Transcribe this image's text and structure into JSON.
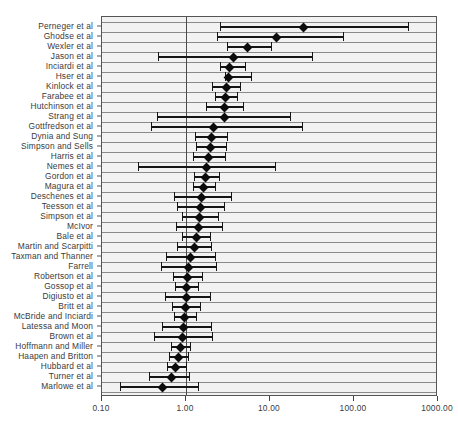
{
  "chart_data": {
    "type": "scatter",
    "subtype": "forest-plot",
    "title": "",
    "xlabel": "",
    "ylabel": "",
    "xscale": "log",
    "xlim": [
      0.1,
      1000.0
    ],
    "xticks": [
      0.1,
      1.0,
      10.0,
      100.0,
      1000.0
    ],
    "xtick_labels": [
      "0.10",
      "1.00",
      "10.00",
      "100.00",
      "1000.00"
    ],
    "reference_line": 1.0,
    "grid": true,
    "legend": "none",
    "marker": "diamond",
    "categories": [
      "Perneger et al",
      "Ghodse et al",
      "Wexler et al",
      "Jason et al",
      "Inciardi et al",
      "Hser et al",
      "Kinlock et al",
      "Farabee et al",
      "Hutchinson et al",
      "Strang et al",
      "Gottfredson et al",
      "Dynia and Sung",
      "Simpson and Sells",
      "Harris et al",
      "Nemes et al",
      "Gordon et al",
      "Magura et al",
      "Deschenes et al",
      "Teesson et al",
      "Simpson et al",
      "McIvor",
      "Bale et al",
      "Martin and Scarpitti",
      "Taxman and Thanner",
      "Farrell",
      "Robertson et al",
      "Gossop et al",
      "Digiusto et al",
      "Britt et al",
      "McBride and Inciardi",
      "Latessa and Moon",
      "Brown et al",
      "Hoffmann and Miller",
      "Haapen and Britton",
      "Hubbard et al",
      "Turner et al",
      "Marlowe et al"
    ],
    "studies": [
      {
        "label": "Perneger et al",
        "estimate": 25.0,
        "ci_low": 2.55,
        "ci_high": 440.0
      },
      {
        "label": "Ghodse et al",
        "estimate": 12.0,
        "ci_low": 2.35,
        "ci_high": 74.0
      },
      {
        "label": "Wexler et al",
        "estimate": 5.4,
        "ci_low": 3.05,
        "ci_high": 10.3
      },
      {
        "label": "Jason et al",
        "estimate": 3.7,
        "ci_low": 0.47,
        "ci_high": 32.0
      },
      {
        "label": "Inciardi et al",
        "estimate": 3.3,
        "ci_low": 2.55,
        "ci_high": 5.1
      },
      {
        "label": "Hser et al",
        "estimate": 3.2,
        "ci_low": 2.9,
        "ci_high": 5.9
      },
      {
        "label": "Kinlock et al",
        "estimate": 3.0,
        "ci_low": 2.02,
        "ci_high": 4.45
      },
      {
        "label": "Farabee et al",
        "estimate": 2.95,
        "ci_low": 2.2,
        "ci_high": 4.0
      },
      {
        "label": "Hutchinson et al",
        "estimate": 2.9,
        "ci_low": 1.75,
        "ci_high": 4.75
      },
      {
        "label": "Strang et al",
        "estimate": 2.85,
        "ci_low": 0.45,
        "ci_high": 17.5
      },
      {
        "label": "Gottfredson et al",
        "estimate": 2.1,
        "ci_low": 0.38,
        "ci_high": 24.0
      },
      {
        "label": "Dynia and Sung",
        "estimate": 2.0,
        "ci_low": 1.28,
        "ci_high": 3.1
      },
      {
        "label": "Simpson and Sells",
        "estimate": 1.95,
        "ci_low": 1.3,
        "ci_high": 3.0
      },
      {
        "label": "Harris et al",
        "estimate": 1.85,
        "ci_low": 1.22,
        "ci_high": 2.9
      },
      {
        "label": "Nemes et al",
        "estimate": 1.75,
        "ci_low": 0.265,
        "ci_high": 11.5
      },
      {
        "label": "Gordon et al",
        "estimate": 1.7,
        "ci_low": 1.23,
        "ci_high": 2.45
      },
      {
        "label": "Magura et al",
        "estimate": 1.6,
        "ci_low": 1.21,
        "ci_high": 2.22
      },
      {
        "label": "Deschenes et al",
        "estimate": 1.55,
        "ci_low": 0.72,
        "ci_high": 3.4
      },
      {
        "label": "Teesson et al",
        "estimate": 1.5,
        "ci_low": 0.78,
        "ci_high": 2.85
      },
      {
        "label": "Simpson et al",
        "estimate": 1.45,
        "ci_low": 0.9,
        "ci_high": 2.4
      },
      {
        "label": "McIvor",
        "estimate": 1.4,
        "ci_low": 0.75,
        "ci_high": 2.65
      },
      {
        "label": "Bale et al",
        "estimate": 1.32,
        "ci_low": 0.9,
        "ci_high": 1.95
      },
      {
        "label": "Martin and Scarpitti",
        "estimate": 1.25,
        "ci_low": 0.78,
        "ci_high": 2.0
      },
      {
        "label": "Taxman and Thanner",
        "estimate": 1.12,
        "ci_low": 0.58,
        "ci_high": 2.2
      },
      {
        "label": "Farrell",
        "estimate": 1.06,
        "ci_low": 0.51,
        "ci_high": 2.25
      },
      {
        "label": "Robertson et al",
        "estimate": 1.03,
        "ci_low": 0.7,
        "ci_high": 1.55
      },
      {
        "label": "Gossop et al",
        "estimate": 1.0,
        "ci_low": 0.74,
        "ci_high": 1.38
      },
      {
        "label": "Digiusto et al",
        "estimate": 1.0,
        "ci_low": 0.56,
        "ci_high": 1.95
      },
      {
        "label": "Britt et al",
        "estimate": 0.98,
        "ci_low": 0.68,
        "ci_high": 1.45
      },
      {
        "label": "McBride and Inciardi",
        "estimate": 0.97,
        "ci_low": 0.72,
        "ci_high": 1.32
      },
      {
        "label": "Latessa and Moon",
        "estimate": 0.94,
        "ci_low": 0.52,
        "ci_high": 2.0
      },
      {
        "label": "Brown et al",
        "estimate": 0.9,
        "ci_low": 0.42,
        "ci_high": 2.05
      },
      {
        "label": "Hoffmann and Miller",
        "estimate": 0.85,
        "ci_low": 0.66,
        "ci_high": 1.12
      },
      {
        "label": "Haapen and Britton",
        "estimate": 0.82,
        "ci_low": 0.62,
        "ci_high": 1.07
      },
      {
        "label": "Hubbard et al",
        "estimate": 0.76,
        "ci_low": 0.6,
        "ci_high": 0.99
      },
      {
        "label": "Turner et al",
        "estimate": 0.68,
        "ci_low": 0.36,
        "ci_high": 1.1
      },
      {
        "label": "Marlowe et al",
        "estimate": 0.52,
        "ci_low": 0.165,
        "ci_high": 1.38
      }
    ],
    "colors": {
      "plot_background": "#f2f2f2",
      "gridline": "#8a8a8a",
      "reference_line": "#4a4a4a",
      "marker": "#0c0c0c",
      "ci_bar": "#151515",
      "text": "#3b3b3b",
      "frame": "#555555"
    }
  }
}
